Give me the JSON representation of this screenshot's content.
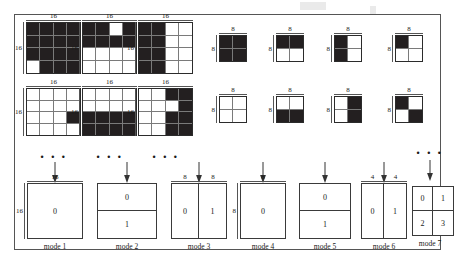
{
  "figure": {
    "colors": {
      "ink": "#231f20",
      "rule": "#7a7a7a",
      "frame": "#555555"
    },
    "ellipsis": "• • •"
  },
  "large_blocks": {
    "size_label": "16",
    "grid": 4,
    "items": [
      {
        "name": "block-16-1",
        "top_label": "16",
        "left_label": "16",
        "cells": [
          1,
          1,
          1,
          1,
          1,
          1,
          1,
          1,
          1,
          1,
          1,
          1,
          0,
          1,
          1,
          1
        ]
      },
      {
        "name": "block-16-2",
        "top_label": "16",
        "left_label": "16",
        "cells": [
          1,
          1,
          0,
          1,
          1,
          1,
          1,
          1,
          0,
          0,
          0,
          0,
          0,
          0,
          0,
          0
        ]
      },
      {
        "name": "block-16-3",
        "top_label": "16",
        "left_label": "16",
        "cells": [
          1,
          1,
          0,
          0,
          1,
          1,
          0,
          0,
          1,
          1,
          0,
          0,
          1,
          1,
          0,
          0
        ]
      },
      {
        "name": "block-16-4",
        "top_label": "16",
        "left_label": "16",
        "cells": [
          0,
          0,
          0,
          0,
          0,
          0,
          0,
          0,
          0,
          0,
          0,
          1,
          0,
          0,
          0,
          0
        ]
      },
      {
        "name": "block-16-5",
        "top_label": "16",
        "left_label": "16",
        "cells": [
          0,
          0,
          0,
          0,
          0,
          0,
          0,
          0,
          1,
          1,
          1,
          1,
          1,
          1,
          1,
          1
        ]
      },
      {
        "name": "block-16-6",
        "top_label": "16",
        "left_label": "16",
        "cells": [
          0,
          0,
          1,
          1,
          0,
          0,
          0,
          1,
          0,
          0,
          1,
          1,
          0,
          0,
          1,
          1
        ]
      }
    ]
  },
  "small_blocks": {
    "size_label": "8",
    "grid": 2,
    "items": [
      {
        "name": "block-8-1",
        "top_label": "8",
        "left_label": "8",
        "cells": [
          1,
          1,
          1,
          1
        ]
      },
      {
        "name": "block-8-2",
        "top_label": "8",
        "left_label": "8",
        "cells": [
          1,
          1,
          0,
          0
        ]
      },
      {
        "name": "block-8-3",
        "top_label": "8",
        "left_label": "8",
        "cells": [
          1,
          0,
          1,
          0
        ]
      },
      {
        "name": "block-8-4",
        "top_label": "8",
        "left_label": "8",
        "cells": [
          1,
          0,
          0,
          0
        ]
      },
      {
        "name": "block-8-5",
        "top_label": "8",
        "left_label": "8",
        "cells": [
          0,
          0,
          0,
          0
        ]
      },
      {
        "name": "block-8-6",
        "top_label": "8",
        "left_label": "8",
        "cells": [
          0,
          0,
          1,
          1
        ]
      },
      {
        "name": "block-8-7",
        "top_label": "8",
        "left_label": "8",
        "cells": [
          0,
          1,
          0,
          1
        ]
      },
      {
        "name": "block-8-8",
        "top_label": "8",
        "left_label": "8",
        "cells": [
          1,
          0,
          0,
          1
        ]
      }
    ]
  },
  "modes": [
    {
      "name": "mode-1",
      "label": "mode 1",
      "layout": "m-1x1",
      "top_labels": [
        "16"
      ],
      "left_label": "16",
      "parts": [
        "0"
      ]
    },
    {
      "name": "mode-2",
      "label": "mode 2",
      "layout": "m-1x2",
      "top_labels": [],
      "left_label": "",
      "parts": [
        "0",
        "1"
      ]
    },
    {
      "name": "mode-3",
      "label": "mode 3",
      "layout": "m-2x1",
      "top_labels": [
        "8",
        "8"
      ],
      "left_label": "",
      "parts": [
        "0",
        "1"
      ]
    },
    {
      "name": "mode-4",
      "label": "mode 4",
      "layout": "m-1x1",
      "top_labels": [
        "8"
      ],
      "left_label": "8",
      "parts": [
        "0"
      ]
    },
    {
      "name": "mode-5",
      "label": "mode 5",
      "layout": "m-1x2",
      "top_labels": [],
      "left_label": "",
      "parts": [
        "0",
        "1"
      ]
    },
    {
      "name": "mode-6",
      "label": "mode 6",
      "layout": "m-2x1",
      "top_labels": [
        "4",
        "4"
      ],
      "left_label": "",
      "parts": [
        "0",
        "1"
      ]
    },
    {
      "name": "mode-7",
      "label": "mode 7",
      "layout": "m-2x2",
      "top_labels": [],
      "left_label": "",
      "parts": [
        "0",
        "1",
        "2",
        "3"
      ]
    }
  ]
}
